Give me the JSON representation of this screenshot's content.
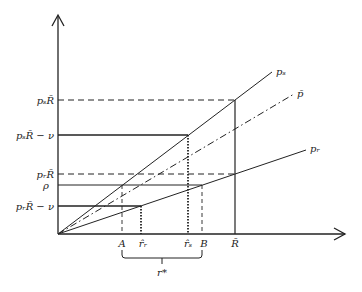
{
  "diagram": {
    "type": "payoff-diagram",
    "axes": {
      "x_arrow": true,
      "y_arrow": true
    },
    "y_labels": {
      "ps_R": "pₛR̄",
      "ps_R_minus_nu": "pₛR̄ − ν",
      "pr_R": "pᵣR̄",
      "rho": "ρ",
      "pr_R_minus_nu": "pᵣR̄ − ν"
    },
    "x_labels": {
      "A": "A",
      "r_hat_r": "r̂ᵣ",
      "r_hat_s": "r̂ₛ",
      "B": "B",
      "R_bar": "R̄"
    },
    "line_labels": {
      "ps": "pₛ",
      "p_bar": "p̄",
      "pr": "pᵣ"
    },
    "brace_label": "r*",
    "colors": {
      "stroke": "#222222",
      "background": "#ffffff"
    }
  }
}
